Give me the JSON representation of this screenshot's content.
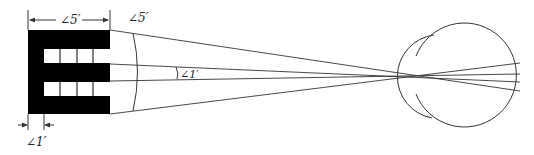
{
  "diagram": {
    "colors": {
      "stroke": "#333333",
      "fill": "#000000",
      "background": "#ffffff"
    },
    "labels": {
      "top_width": "∠5′",
      "arc_angle": "∠5′",
      "inner_angle": "∠1′",
      "stroke_width": "∠1′"
    },
    "elements": [
      {
        "name": "optotype-E",
        "description": "Black E optotype with 5×5 grid, 1′ per stroke"
      },
      {
        "name": "visual-angle-rays",
        "description": "Rays from E edges converging to the eye's nodal point"
      },
      {
        "name": "eyeball",
        "description": "Eyeball with cornea bulge"
      }
    ]
  }
}
